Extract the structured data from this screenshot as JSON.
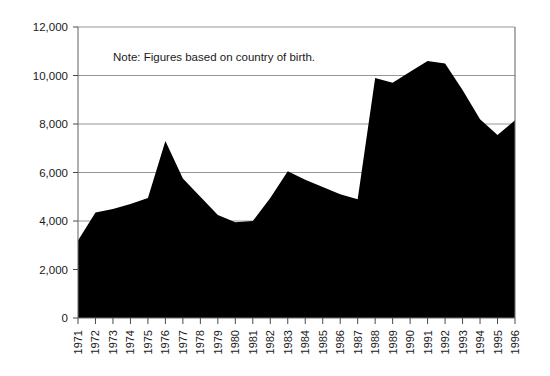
{
  "chart_data": {
    "type": "area",
    "title": "",
    "xlabel": "",
    "ylabel": "",
    "annotation": "Note: Figures based on country of birth.",
    "grid": true,
    "legend": "none",
    "series_color": "#000000",
    "xlim": [
      1971,
      1996
    ],
    "ylim": [
      0,
      12000
    ],
    "ytick_step": 2000,
    "ytick_labels": [
      "12,000",
      "10,000",
      "8,000",
      "6,000",
      "4,000",
      "2,000",
      "0"
    ],
    "ytick_values": [
      12000,
      10000,
      8000,
      6000,
      4000,
      2000,
      0
    ],
    "categories": [
      "1971",
      "1972",
      "1973",
      "1974",
      "1975",
      "1976",
      "1977",
      "1978",
      "1979",
      "1980",
      "1981",
      "1982",
      "1983",
      "1984",
      "1985",
      "1986",
      "1987",
      "1988",
      "1989",
      "1990",
      "1991",
      "1992",
      "1993",
      "1994",
      "1995",
      "1996"
    ],
    "values": [
      3200,
      4350,
      4500,
      4700,
      4950,
      7300,
      5750,
      5000,
      4250,
      3950,
      4000,
      4950,
      6050,
      5700,
      5400,
      5100,
      4900,
      9900,
      9700,
      10150,
      10600,
      10500,
      9400,
      8200,
      7550,
      8150
    ],
    "series": [
      {
        "name": "Immigrants",
        "values": [
          3200,
          4350,
          4500,
          4700,
          4950,
          7300,
          5750,
          5000,
          4250,
          3950,
          4000,
          4950,
          6050,
          5700,
          5400,
          5100,
          4900,
          9900,
          9700,
          10150,
          10600,
          10500,
          9400,
          8200,
          7550,
          8150
        ]
      }
    ]
  }
}
